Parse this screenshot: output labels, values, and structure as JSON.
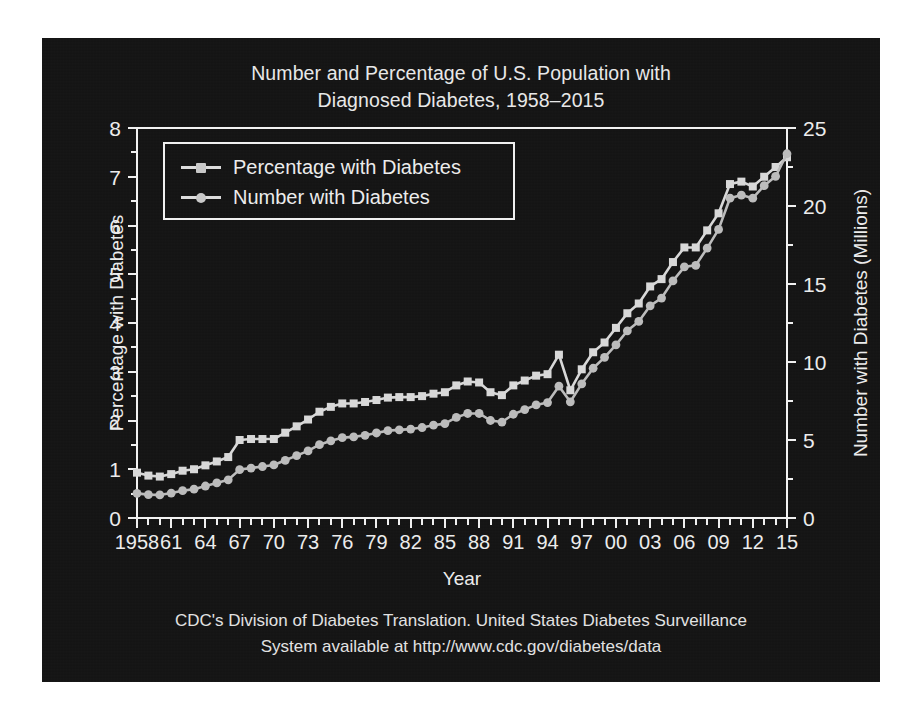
{
  "title": {
    "line1": "Number and Percentage of U.S. Population with",
    "line2": "Diagnosed Diabetes, 1958–2015"
  },
  "footer": {
    "line1": "CDC's Division of Diabetes Translation. United States Diabetes Surveillance",
    "line2": "System available at http://www.cdc.gov/diabetes/data"
  },
  "legend": {
    "items": [
      {
        "label": "Percentage with Diabetes",
        "marker": "square",
        "color": "#d2d2d2"
      },
      {
        "label": "Number with Diabetes",
        "marker": "circle",
        "color": "#c0c0c0"
      }
    ]
  },
  "colors": {
    "panel_background": "#141414",
    "page_background": "#ffffff",
    "axis": "#f2f2f2",
    "text": "#ececec",
    "percentage_series": "#d8d8d8",
    "number_series": "#bcbcbc"
  },
  "chart_data": {
    "type": "line",
    "title": "Number and Percentage of U.S. Population with Diagnosed Diabetes, 1958–2015",
    "xlabel": "Year",
    "ylabel": "Percentage with Diabetes",
    "ylabel_right": "Number with Diabetes (Millions)",
    "xlim": [
      1958,
      2015
    ],
    "ylim": [
      0,
      8
    ],
    "ylim_right": [
      0,
      25
    ],
    "yticks": [
      0,
      1,
      2,
      3,
      4,
      5,
      6,
      7,
      8
    ],
    "yticks_right": [
      0,
      5,
      10,
      15,
      20,
      25
    ],
    "xticks": [
      1958,
      1961,
      1964,
      1967,
      1970,
      1973,
      1976,
      1979,
      1982,
      1985,
      1988,
      1991,
      1994,
      1997,
      2000,
      2003,
      2006,
      2009,
      2012,
      2015
    ],
    "xtick_labels": [
      "1958",
      "61",
      "64",
      "67",
      "70",
      "73",
      "76",
      "79",
      "82",
      "85",
      "88",
      "91",
      "94",
      "97",
      "00",
      "03",
      "06",
      "09",
      "12",
      "15"
    ],
    "grid": false,
    "legend_position": "upper left",
    "x": [
      1958,
      1959,
      1960,
      1961,
      1962,
      1963,
      1964,
      1965,
      1966,
      1967,
      1968,
      1969,
      1970,
      1971,
      1972,
      1973,
      1974,
      1975,
      1976,
      1977,
      1978,
      1979,
      1980,
      1981,
      1982,
      1983,
      1984,
      1985,
      1986,
      1987,
      1988,
      1989,
      1990,
      1991,
      1992,
      1993,
      1994,
      1995,
      1996,
      1997,
      1998,
      1999,
      2000,
      2001,
      2002,
      2003,
      2004,
      2005,
      2006,
      2007,
      2008,
      2009,
      2010,
      2011,
      2012,
      2013,
      2014,
      2015
    ],
    "series": [
      {
        "name": "Percentage with Diabetes",
        "axis": "left",
        "unit": "percent",
        "marker": "square",
        "values": [
          0.93,
          0.87,
          0.85,
          0.9,
          0.97,
          1.0,
          1.08,
          1.16,
          1.25,
          1.6,
          1.62,
          1.62,
          1.62,
          1.75,
          1.88,
          2.02,
          2.18,
          2.28,
          2.35,
          2.35,
          2.38,
          2.42,
          2.47,
          2.48,
          2.48,
          2.5,
          2.55,
          2.58,
          2.72,
          2.8,
          2.78,
          2.58,
          2.52,
          2.72,
          2.82,
          2.92,
          2.95,
          3.35,
          2.62,
          3.05,
          3.4,
          3.6,
          3.9,
          4.2,
          4.4,
          4.75,
          4.9,
          5.25,
          5.55,
          5.55,
          5.9,
          6.25,
          6.85,
          6.9,
          6.8,
          7.0,
          7.2,
          7.4
        ]
      },
      {
        "name": "Number with Diabetes",
        "axis": "right",
        "unit": "millions",
        "marker": "circle",
        "values": [
          1.58,
          1.5,
          1.48,
          1.6,
          1.75,
          1.85,
          2.05,
          2.25,
          2.45,
          3.1,
          3.2,
          3.3,
          3.4,
          3.7,
          4.0,
          4.3,
          4.7,
          4.95,
          5.15,
          5.2,
          5.3,
          5.45,
          5.6,
          5.65,
          5.7,
          5.8,
          5.95,
          6.05,
          6.45,
          6.7,
          6.7,
          6.25,
          6.15,
          6.65,
          6.95,
          7.25,
          7.4,
          8.45,
          7.45,
          8.6,
          9.6,
          10.3,
          11.1,
          12.0,
          12.6,
          13.6,
          14.1,
          15.2,
          16.1,
          16.2,
          17.3,
          18.5,
          20.5,
          20.7,
          20.5,
          21.3,
          21.9,
          23.35
        ]
      }
    ]
  }
}
